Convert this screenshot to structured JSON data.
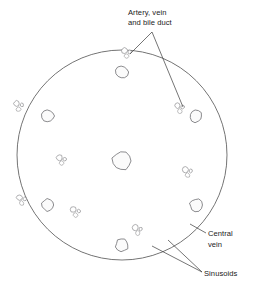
{
  "figure": {
    "background_color": "#ffffff",
    "ink_color": "#4a4a52",
    "outline_color": "#5a5a5a",
    "label_color": "#1a1a1a",
    "leader_color": "#3a3a3a",
    "width": 253,
    "height": 290
  },
  "labels": [
    {
      "id": "portal-triad",
      "line1": "Artery, vein",
      "line2": "and bile duct",
      "text": "Artery, vein and bile duct",
      "x": 128,
      "y": 14,
      "anchor": "start",
      "leader": "fork"
    },
    {
      "id": "central-vein",
      "line1": "Central",
      "line2": "vein",
      "text": "Central vein",
      "x": 208,
      "y": 234,
      "anchor": "start",
      "leader": "single"
    },
    {
      "id": "sinusoids",
      "line1": "Sinusoids",
      "line2": "",
      "text": "Sinusoids",
      "x": 204,
      "y": 276,
      "anchor": "start",
      "leader": "fork"
    }
  ],
  "structures": {
    "outer_boundary": {
      "name": "liver tissue section outline",
      "shape": "circle",
      "cx": 122,
      "cy": 155,
      "r": 105
    },
    "central_lobule": {
      "name": "central hepatic lobule",
      "cx": 122,
      "cy": 158,
      "radius": 62,
      "central_vein": {
        "cx": 122,
        "cy": 161,
        "r": 9.5
      }
    },
    "peripheral_lobules": [
      {
        "name": "lobule-top",
        "cx": 122,
        "cy": 72,
        "angle": -90,
        "r": 44
      },
      {
        "name": "lobule-upper-right",
        "cx": 196,
        "cy": 116,
        "angle": -30,
        "r": 44
      },
      {
        "name": "lobule-lower-right",
        "cx": 196,
        "cy": 205,
        "angle": 30,
        "r": 44
      },
      {
        "name": "lobule-bottom",
        "cx": 122,
        "cy": 245,
        "angle": 90,
        "r": 44
      },
      {
        "name": "lobule-lower-left",
        "cx": 48,
        "cy": 205,
        "angle": 150,
        "r": 44
      },
      {
        "name": "lobule-upper-left",
        "cx": 48,
        "cy": 116,
        "angle": -150,
        "r": 44
      }
    ],
    "portal_triads": [
      {
        "name": "portal-triad-top",
        "cx": 127,
        "cy": 53
      },
      {
        "name": "portal-triad-upper-right",
        "cx": 180,
        "cy": 108
      },
      {
        "name": "portal-triad-right",
        "cx": 188,
        "cy": 172
      },
      {
        "name": "portal-triad-lower-right",
        "cx": 138,
        "cy": 230
      },
      {
        "name": "portal-triad-lower-left",
        "cx": 76,
        "cy": 212
      },
      {
        "name": "portal-triad-left",
        "cx": 62,
        "cy": 160
      },
      {
        "name": "portal-triad-upper-left",
        "cx": 19,
        "cy": 106
      },
      {
        "name": "portal-triad-edge-left",
        "cx": 22,
        "cy": 200
      }
    ],
    "sinusoid_rendering": {
      "description": "elongated outlined hepatic cords radiating from each central vein",
      "stroke": "#4a4a52",
      "fill": "#ffffff"
    }
  }
}
